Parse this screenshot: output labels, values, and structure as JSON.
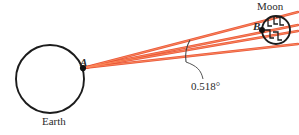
{
  "figure": {
    "title_alt": "Angular diameter of the Moon as seen from Earth",
    "colors": {
      "ray": "#E8492A",
      "ray_core": "#F4612F",
      "outline": "#1c1c1c",
      "text": "#2b2b2b",
      "leader": "#555555",
      "background": "#ffffff"
    },
    "labels": {
      "earth": "Earth",
      "moon": "Moon",
      "point_a": "A",
      "point_b": "B",
      "angle": "0.518°"
    },
    "bodies": {
      "earth": {
        "cx": 50,
        "cy": 79,
        "r": 34
      },
      "moon": {
        "cx": 276,
        "cy": 30,
        "r": 14
      }
    },
    "points": {
      "a": {
        "x": 83,
        "y": 68
      },
      "b": {
        "x": 262,
        "y": 30
      }
    },
    "rays": [
      {
        "name": "ray-to-moon-top",
        "x1": 83,
        "y1": 68,
        "x2": 298,
        "y2": 12
      },
      {
        "name": "ray-to-moon-center",
        "x1": 83,
        "y1": 68,
        "x2": 298,
        "y2": 25
      },
      {
        "name": "ray-to-point-b",
        "x1": 83,
        "y1": 68,
        "x2": 298,
        "y2": 31
      },
      {
        "name": "ray-to-moon-bottom",
        "x1": 83,
        "y1": 68,
        "x2": 298,
        "y2": 44
      }
    ],
    "angle_marker": {
      "tick_x1": 190,
      "tick_y1": 40,
      "tick_x2": 186,
      "tick_y2": 62,
      "leader_path": "M 186,62 C 197,66 201,70 203,79"
    },
    "moon_hatch_marks": 5
  }
}
